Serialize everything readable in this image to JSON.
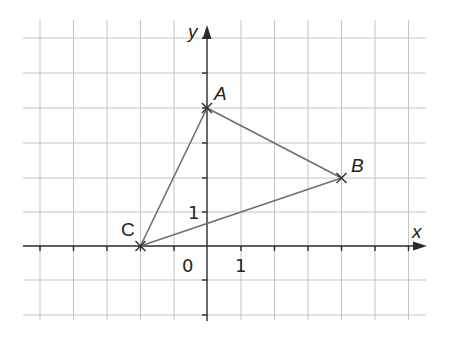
{
  "diagram": {
    "type": "coordinate-plane-triangle",
    "axes": {
      "x_label": "x",
      "y_label": "y",
      "origin_label": "0",
      "x_unit_label": "1",
      "y_unit_label": "1",
      "x_range": [
        -5,
        6
      ],
      "y_range": [
        -2,
        6
      ]
    },
    "points": [
      {
        "name": "A",
        "x": 0,
        "y": 4
      },
      {
        "name": "B",
        "x": 4,
        "y": 2
      },
      {
        "name": "C",
        "x": -2,
        "y": 0
      }
    ],
    "segments": [
      [
        "A",
        "B"
      ],
      [
        "B",
        "C"
      ],
      [
        "C",
        "A"
      ]
    ],
    "colors": {
      "grid": "#c4c4c4",
      "axis": "#2a2a2a",
      "triangle": "#6e6e6e",
      "text": "#222222"
    }
  }
}
